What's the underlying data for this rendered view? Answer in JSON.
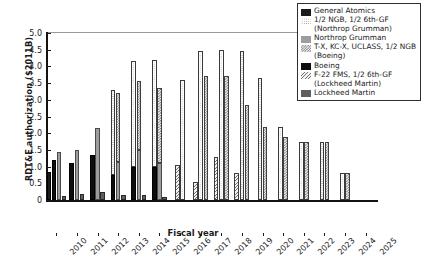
{
  "chart_data": {
    "type": "bar",
    "title": "",
    "xlabel": "Fiscal year",
    "ylabel": "RDT&E authorization ($2011B)",
    "ylim": [
      0,
      5.0
    ],
    "ytick_labels": [
      "0",
      "0.5",
      "1.0",
      "1.5",
      "2.0",
      "2.5",
      "3.0",
      "3.5",
      "4.0",
      "4.5",
      "5.0"
    ],
    "ytick_values": [
      0,
      0.5,
      1.0,
      1.5,
      2.0,
      2.5,
      3.0,
      3.5,
      4.0,
      4.5,
      5.0
    ],
    "grid": false,
    "legend_position": "top-right",
    "stacked": true,
    "categories": [
      "2010",
      "2011",
      "2012",
      "2013",
      "2014",
      "2015",
      "2016",
      "2017",
      "2018",
      "2019",
      "2020",
      "2021",
      "2022",
      "2023",
      "2024",
      "2025"
    ],
    "series": [
      {
        "name": "General Atomics",
        "fill": "f0",
        "values": [
          0.85,
          0.0,
          0.0,
          0.0,
          0.0,
          0.0,
          0.0,
          0.0,
          0.0,
          0.0,
          0.0,
          0.0,
          0.0,
          0.0,
          0.0,
          0.0
        ]
      },
      {
        "name": "1/2 NGB, 1/2 6th-GF (Northrop Grumman)",
        "fill": "f1",
        "values": [
          0.0,
          0.0,
          0.0,
          3.3,
          4.15,
          4.2,
          3.6,
          4.45,
          4.5,
          3.7,
          3.65,
          2.2,
          1.75,
          1.75,
          0.8,
          0.0
        ]
      },
      {
        "name": "Northrop Grumman",
        "fill": "f2",
        "values": [
          1.45,
          1.5,
          2.15,
          0.0,
          0.0,
          0.0,
          0.0,
          0.0,
          0.0,
          0.0,
          0.0,
          0.0,
          0.0,
          0.0,
          0.0,
          0.0
        ]
      },
      {
        "name": "T-X, KC-X, UCLASS, 1/2 NGB (Boeing)",
        "fill": "f3",
        "values": [
          0.0,
          0.0,
          0.0,
          3.2,
          3.55,
          3.35,
          0.0,
          3.7,
          3.7,
          2.85,
          2.2,
          1.9,
          1.75,
          1.75,
          0.8,
          0.0
        ]
      },
      {
        "name": "Boeing",
        "fill": "f4",
        "values": [
          1.2,
          1.1,
          1.35,
          0.75,
          1.0,
          1.0,
          0.0,
          0.0,
          0.0,
          0.0,
          0.0,
          0.0,
          0.0,
          0.0,
          0.0,
          0.0
        ]
      },
      {
        "name": "F-22 FMS, 1/2 6th-GF (Lockheed Martin)",
        "fill": "f5",
        "values": [
          0.0,
          0.0,
          0.0,
          0.0,
          0.0,
          0.0,
          1.05,
          0.55,
          1.3,
          0.8,
          0.0,
          0.0,
          0.0,
          0.0,
          0.0,
          0.0
        ]
      },
      {
        "name": "Lockheed Martin",
        "fill": "f6",
        "values": [
          0.12,
          0.18,
          0.25,
          0.15,
          0.15,
          0.08,
          0.0,
          0.0,
          0.0,
          0.0,
          0.0,
          0.0,
          0.0,
          0.0,
          0.0,
          0.0
        ]
      }
    ],
    "bar_layout": [
      {
        "year": "2010",
        "bars": [
          {
            "series": 0,
            "segments": [
              {
                "fill": "f0",
                "v": 0.85
              }
            ]
          },
          {
            "series": 4,
            "segments": [
              {
                "fill": "f4",
                "v": 1.2
              }
            ]
          },
          {
            "series": 2,
            "segments": [
              {
                "fill": "f2",
                "v": 1.45
              }
            ]
          },
          {
            "series": 6,
            "segments": [
              {
                "fill": "f6",
                "v": 0.12
              }
            ]
          }
        ]
      },
      {
        "year": "2011",
        "bars": [
          {
            "series": 4,
            "segments": [
              {
                "fill": "f4",
                "v": 1.1
              }
            ]
          },
          {
            "series": 2,
            "segments": [
              {
                "fill": "f2",
                "v": 1.5
              }
            ]
          },
          {
            "series": 6,
            "segments": [
              {
                "fill": "f6",
                "v": 0.18
              }
            ]
          }
        ]
      },
      {
        "year": "2012",
        "bars": [
          {
            "series": 4,
            "segments": [
              {
                "fill": "f4",
                "v": 1.35
              }
            ]
          },
          {
            "series": 2,
            "segments": [
              {
                "fill": "f2",
                "v": 2.15
              }
            ]
          },
          {
            "series": 6,
            "segments": [
              {
                "fill": "f6",
                "v": 0.25
              }
            ]
          }
        ]
      },
      {
        "year": "2013",
        "bars": [
          {
            "series": 1,
            "segments": [
              {
                "fill": "f4",
                "v": 0.75
              },
              {
                "fill": "f1",
                "v": 2.55
              }
            ]
          },
          {
            "series": 3,
            "segments": [
              {
                "fill": "f2",
                "v": 1.15
              },
              {
                "fill": "f3",
                "v": 2.05
              }
            ]
          },
          {
            "series": 6,
            "segments": [
              {
                "fill": "f6",
                "v": 0.15
              }
            ]
          }
        ]
      },
      {
        "year": "2014",
        "bars": [
          {
            "series": 1,
            "segments": [
              {
                "fill": "f4",
                "v": 1.0
              },
              {
                "fill": "f1",
                "v": 3.15
              }
            ]
          },
          {
            "series": 3,
            "segments": [
              {
                "fill": "f2",
                "v": 1.5
              },
              {
                "fill": "f3",
                "v": 2.05
              }
            ]
          },
          {
            "series": 6,
            "segments": [
              {
                "fill": "f6",
                "v": 0.15
              }
            ]
          }
        ]
      },
      {
        "year": "2015",
        "bars": [
          {
            "series": 1,
            "segments": [
              {
                "fill": "f4",
                "v": 1.0
              },
              {
                "fill": "f1",
                "v": 3.2
              }
            ]
          },
          {
            "series": 3,
            "segments": [
              {
                "fill": "f2",
                "v": 1.1
              },
              {
                "fill": "f3",
                "v": 2.25
              }
            ]
          },
          {
            "series": 6,
            "segments": [
              {
                "fill": "f6",
                "v": 0.08
              }
            ]
          }
        ]
      },
      {
        "year": "2016",
        "bars": [
          {
            "series": 5,
            "segments": [
              {
                "fill": "f5",
                "v": 1.05
              }
            ]
          },
          {
            "series": 1,
            "segments": [
              {
                "fill": "f1",
                "v": 3.6
              }
            ]
          }
        ]
      },
      {
        "year": "2017",
        "bars": [
          {
            "series": 5,
            "segments": [
              {
                "fill": "f5",
                "v": 0.55
              }
            ]
          },
          {
            "series": 1,
            "segments": [
              {
                "fill": "f1",
                "v": 4.45
              }
            ]
          },
          {
            "series": 3,
            "segments": [
              {
                "fill": "f3",
                "v": 3.7
              }
            ]
          }
        ]
      },
      {
        "year": "2018",
        "bars": [
          {
            "series": 5,
            "segments": [
              {
                "fill": "f5",
                "v": 1.3
              }
            ]
          },
          {
            "series": 1,
            "segments": [
              {
                "fill": "f1",
                "v": 4.5
              }
            ]
          },
          {
            "series": 3,
            "segments": [
              {
                "fill": "f3",
                "v": 3.7
              }
            ]
          }
        ]
      },
      {
        "year": "2019",
        "bars": [
          {
            "series": 5,
            "segments": [
              {
                "fill": "f5",
                "v": 0.8
              }
            ]
          },
          {
            "series": 1,
            "segments": [
              {
                "fill": "f1",
                "v": 4.45
              }
            ]
          },
          {
            "series": 3,
            "segments": [
              {
                "fill": "f3",
                "v": 2.85
              }
            ]
          }
        ]
      },
      {
        "year": "2020",
        "bars": [
          {
            "series": 1,
            "segments": [
              {
                "fill": "f1",
                "v": 3.65
              }
            ]
          },
          {
            "series": 3,
            "segments": [
              {
                "fill": "f3",
                "v": 2.2
              }
            ]
          }
        ]
      },
      {
        "year": "2021",
        "bars": [
          {
            "series": 1,
            "segments": [
              {
                "fill": "f1",
                "v": 2.2
              }
            ]
          },
          {
            "series": 3,
            "segments": [
              {
                "fill": "f3",
                "v": 1.9
              }
            ]
          }
        ]
      },
      {
        "year": "2022",
        "bars": [
          {
            "series": 1,
            "segments": [
              {
                "fill": "f1",
                "v": 1.75
              }
            ]
          },
          {
            "series": 3,
            "segments": [
              {
                "fill": "f3",
                "v": 1.75
              }
            ]
          }
        ]
      },
      {
        "year": "2023",
        "bars": [
          {
            "series": 1,
            "segments": [
              {
                "fill": "f1",
                "v": 1.75
              }
            ]
          },
          {
            "series": 3,
            "segments": [
              {
                "fill": "f3",
                "v": 1.75
              }
            ]
          }
        ]
      },
      {
        "year": "2024",
        "bars": [
          {
            "series": 1,
            "segments": [
              {
                "fill": "f1",
                "v": 0.8
              }
            ]
          },
          {
            "series": 3,
            "segments": [
              {
                "fill": "f3",
                "v": 0.8
              }
            ]
          }
        ]
      },
      {
        "year": "2025",
        "bars": []
      }
    ]
  },
  "legend": {
    "entries": [
      {
        "label": "General Atomics",
        "cont": "",
        "fill": "f0"
      },
      {
        "label": "1/2 NGB, 1/2 6th-GF",
        "cont": "(Northrop Grumman)",
        "fill": "f1"
      },
      {
        "label": "Northrop Grumman",
        "cont": "",
        "fill": "f2"
      },
      {
        "label": "T-X, KC-X, UCLASS, 1/2 NGB",
        "cont": "(Boeing)",
        "fill": "f3"
      },
      {
        "label": "Boeing",
        "cont": "",
        "fill": "f4"
      },
      {
        "label": "F-22 FMS, 1/2 6th-GF",
        "cont": "(Lockheed Martin)",
        "fill": "f5"
      },
      {
        "label": "Lockheed Martin",
        "cont": "",
        "fill": "f6"
      }
    ]
  }
}
